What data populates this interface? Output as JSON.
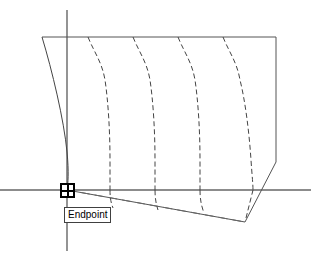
{
  "app": {
    "title": "CAD Drawing Area",
    "background_color": "#ffffff"
  },
  "snap": {
    "marker_name": "endpoint-snap-marker",
    "tooltip_label": "Endpoint",
    "marker_color": "#000000",
    "tooltip_border_color": "#404040",
    "marker_x": 60,
    "marker_y": 183,
    "marker_size": 15,
    "tooltip_x": 64,
    "tooltip_y": 207
  },
  "drawing": {
    "line_color": "#555555",
    "curve_color": "#444444",
    "axis_color": "#666666",
    "axes": {
      "horizontal": {
        "x1": 0,
        "y1": 190,
        "x2": 311,
        "y2": 190
      },
      "vertical": {
        "x1": 67,
        "y1": 10,
        "x2": 67,
        "y2": 251
      }
    },
    "top_edge": {
      "x1": 42,
      "y1": 37,
      "x2": 276,
      "y2": 37
    },
    "right_edge": {
      "x1": 276,
      "y1": 37,
      "x2": 276,
      "y2": 162
    },
    "right_lower_edge": {
      "x1": 276,
      "y1": 162,
      "x2": 245,
      "y2": 222
    },
    "bottom_edge": {
      "x1": 67,
      "y1": 190,
      "x2": 245,
      "y2": 222
    },
    "solid_curve": "M 42,37 C 52,70 64,120 67,152 C 69,172 68,184 67,190",
    "dashed_curves": [
      "M 88,37 C 94,52 102,62 105,80 C 108,100 110,130 110,160 C 110,175 110,184 110,190",
      "M 133,37 C 139,52 147,62 150,80 C 153,100 155,130 155,160 C 155,175 155,184 155,190",
      "M 178,37 C 184,52 192,62 195,80 C 198,100 200,130 200,160 C 200,175 200,184 200,190",
      "M 223,37 C 229,52 237,62 240,80 C 245,100 249,130 251,160 C 252,175 253,184 253,190"
    ],
    "dashed_curve_tails": [
      "M 110,190 C 110,198 111,203 113,208",
      "M 155,190 C 155,198 156,204 158,210",
      "M 200,190 C 200,198 201,205 204,213",
      "M 253,190 C 251,198 249,206 246,218"
    ],
    "rubber_band": {
      "x1": 67,
      "y1": 190,
      "x2": 245,
      "y2": 222
    },
    "dash_pattern": "5,3"
  }
}
